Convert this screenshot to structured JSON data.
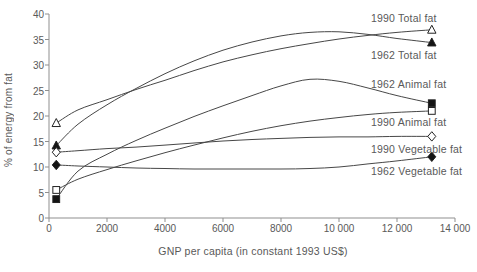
{
  "chart_data": {
    "type": "line",
    "title": "",
    "xlabel": "GNP per capita (in constant 1993 US$)",
    "ylabel": "% of energy from fat",
    "xlim": [
      0,
      14000
    ],
    "ylim": [
      0,
      40
    ],
    "grid": false,
    "legend_position": "right-inline-annotations",
    "x_ticks": {
      "values": [
        0,
        2000,
        4000,
        6000,
        8000,
        10000,
        12000,
        14000
      ],
      "labels": [
        "0",
        "2000",
        "4000",
        "6000",
        "8000",
        "10 000",
        "12 000",
        "14 000"
      ]
    },
    "y_ticks": {
      "values": [
        0,
        5,
        10,
        15,
        20,
        25,
        30,
        35,
        40
      ],
      "labels": [
        "0",
        "5",
        "10",
        "15",
        "20",
        "25",
        "30",
        "35",
        "40"
      ]
    },
    "colors": {
      "line": "#474747",
      "axis": "#8f8f8f",
      "marker_stroke": "#222222",
      "marker_open_fill": "#ffffff",
      "marker_filled_fill": "#141414",
      "text": "#595959",
      "background": "#ffffff"
    },
    "series": [
      {
        "name": "1990 Total fat",
        "marker": "open-triangle",
        "points": [
          [
            250,
            18.6
          ],
          [
            1000,
            21.2
          ],
          [
            2000,
            23.2
          ],
          [
            3000,
            25.2
          ],
          [
            4000,
            27.0
          ],
          [
            5000,
            28.9
          ],
          [
            6000,
            30.6
          ],
          [
            7000,
            32.0
          ],
          [
            8000,
            33.2
          ],
          [
            9000,
            34.2
          ],
          [
            10000,
            35.1
          ],
          [
            11000,
            35.8
          ],
          [
            12000,
            36.4
          ],
          [
            13200,
            36.9
          ]
        ]
      },
      {
        "name": "1962 Total fat",
        "marker": "filled-triangle",
        "points": [
          [
            250,
            14.2
          ],
          [
            1000,
            18.4
          ],
          [
            2000,
            22.2
          ],
          [
            3000,
            25.4
          ],
          [
            4000,
            28.3
          ],
          [
            5000,
            30.8
          ],
          [
            6000,
            32.9
          ],
          [
            7000,
            34.5
          ],
          [
            8000,
            35.7
          ],
          [
            9000,
            36.4
          ],
          [
            10000,
            36.5
          ],
          [
            11000,
            36.0
          ],
          [
            12000,
            35.2
          ],
          [
            13200,
            34.4
          ]
        ]
      },
      {
        "name": "1962 Animal fat",
        "marker": "filled-square",
        "points": [
          [
            250,
            3.7
          ],
          [
            1000,
            9.2
          ],
          [
            2000,
            12.5
          ],
          [
            3000,
            15.2
          ],
          [
            4000,
            17.6
          ],
          [
            5000,
            19.9
          ],
          [
            6000,
            22.0
          ],
          [
            7000,
            24.0
          ],
          [
            8000,
            25.9
          ],
          [
            9000,
            27.2
          ],
          [
            10000,
            26.8
          ],
          [
            11000,
            25.5
          ],
          [
            12000,
            24.0
          ],
          [
            13200,
            22.5
          ]
        ]
      },
      {
        "name": "1990 Animal fat",
        "marker": "open-square",
        "points": [
          [
            250,
            5.5
          ],
          [
            1000,
            7.6
          ],
          [
            2000,
            9.5
          ],
          [
            3000,
            11.2
          ],
          [
            4000,
            12.8
          ],
          [
            5000,
            14.3
          ],
          [
            6000,
            15.7
          ],
          [
            7000,
            17.0
          ],
          [
            8000,
            18.1
          ],
          [
            9000,
            19.0
          ],
          [
            10000,
            19.7
          ],
          [
            11000,
            20.3
          ],
          [
            12000,
            20.7
          ],
          [
            13200,
            21.0
          ]
        ]
      },
      {
        "name": "1990 Vegetable fat",
        "marker": "open-diamond",
        "points": [
          [
            250,
            12.9
          ],
          [
            1000,
            13.2
          ],
          [
            2000,
            13.6
          ],
          [
            3000,
            13.9
          ],
          [
            4000,
            14.3
          ],
          [
            5000,
            14.7
          ],
          [
            6000,
            15.1
          ],
          [
            7000,
            15.4
          ],
          [
            8000,
            15.6
          ],
          [
            9000,
            15.8
          ],
          [
            10000,
            15.9
          ],
          [
            11000,
            15.9
          ],
          [
            12000,
            16.0
          ],
          [
            13200,
            16.0
          ]
        ]
      },
      {
        "name": "1962 Vegetable fat",
        "marker": "filled-diamond",
        "points": [
          [
            250,
            10.4
          ],
          [
            1000,
            10.2
          ],
          [
            2000,
            10.0
          ],
          [
            3000,
            9.8
          ],
          [
            4000,
            9.7
          ],
          [
            5000,
            9.6
          ],
          [
            6000,
            9.6
          ],
          [
            7000,
            9.6
          ],
          [
            8000,
            9.6
          ],
          [
            9000,
            9.7
          ],
          [
            10000,
            10.0
          ],
          [
            11000,
            10.6
          ],
          [
            12000,
            11.2
          ],
          [
            13200,
            12.0
          ]
        ]
      }
    ]
  }
}
